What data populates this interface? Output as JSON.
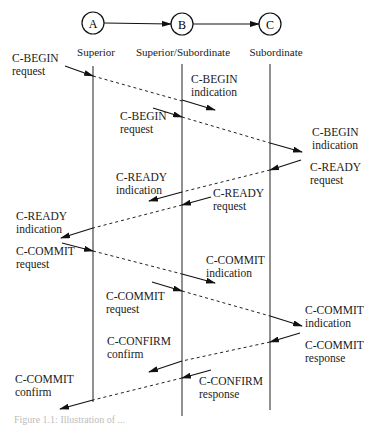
{
  "nodes": [
    {
      "id": "A",
      "letter": "A",
      "role": "Superior",
      "x": 93
    },
    {
      "id": "B",
      "letter": "B",
      "role": "Superior/Subordinate",
      "x": 182
    },
    {
      "id": "C",
      "letter": "C",
      "role": "Subordinate",
      "x": 270
    }
  ],
  "messages": [
    {
      "primitive": "C-BEGIN",
      "type": "request",
      "label_x": 12,
      "label_y": 52
    },
    {
      "primitive": "C-BEGIN",
      "type": "indication",
      "label_x": 191,
      "label_y": 73
    },
    {
      "primitive": "C-BEGIN",
      "type": "request",
      "label_x": 120,
      "label_y": 110
    },
    {
      "primitive": "C-BEGIN",
      "type": "indication",
      "label_x": 312,
      "label_y": 126
    },
    {
      "primitive": "C-READY",
      "type": "request",
      "label_x": 310,
      "label_y": 161
    },
    {
      "primitive": "C-READY",
      "type": "indication",
      "label_x": 116,
      "label_y": 171
    },
    {
      "primitive": "C-READY",
      "type": "request",
      "label_x": 213,
      "label_y": 187
    },
    {
      "primitive": "C-READY",
      "type": "indication",
      "label_x": 16,
      "label_y": 210
    },
    {
      "primitive": "C-COMMIT",
      "type": "request",
      "label_x": 16,
      "label_y": 245
    },
    {
      "primitive": "C-COMMIT",
      "type": "indication",
      "label_x": 206,
      "label_y": 254
    },
    {
      "primitive": "C-COMMIT",
      "type": "request",
      "label_x": 106,
      "label_y": 290
    },
    {
      "primitive": "C-COMMIT",
      "type": "indication",
      "label_x": 305,
      "label_y": 304
    },
    {
      "primitive": "C-COMMIT",
      "type": "response",
      "label_x": 305,
      "label_y": 339
    },
    {
      "primitive": "C-CONFIRM",
      "type": "confirm",
      "label_x": 107,
      "label_y": 335
    },
    {
      "primitive": "C-CONFIRM",
      "type": "response",
      "label_x": 199,
      "label_y": 375
    },
    {
      "primitive": "C-COMMIT",
      "type": "confirm",
      "label_x": 15,
      "label_y": 373
    }
  ],
  "caption": "Figure 1.1: Illustration of ..."
}
